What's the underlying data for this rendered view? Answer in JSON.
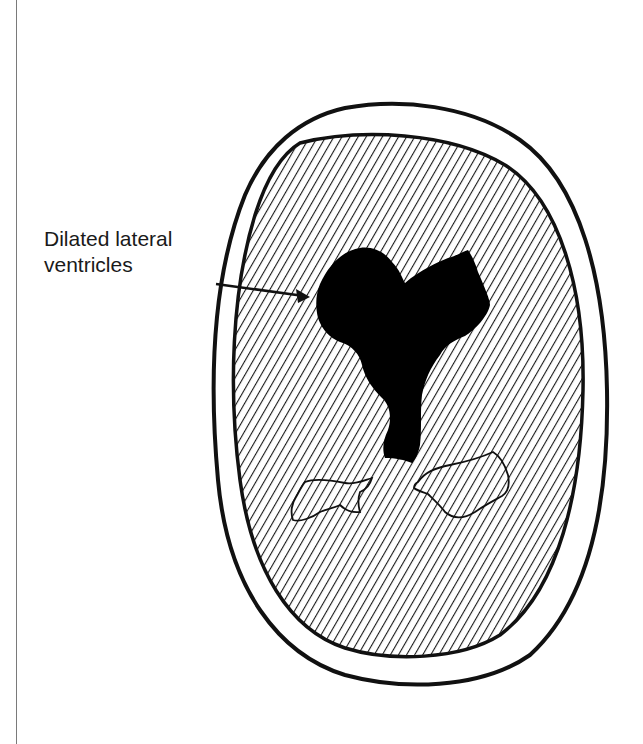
{
  "figure": {
    "type": "medical-illustration",
    "label": {
      "line1": "Dilated lateral",
      "line2": "ventricles"
    },
    "colors": {
      "ink": "#111111",
      "background": "#ffffff",
      "ventricle_fill": "#000000",
      "hatching": "#1a1a1a",
      "page_rule": "#7a7a7a"
    }
  }
}
